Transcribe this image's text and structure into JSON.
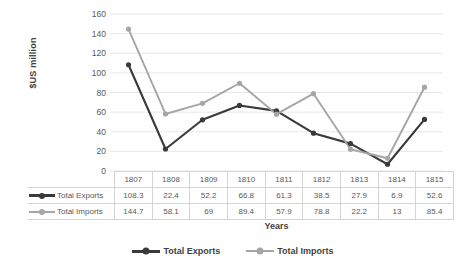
{
  "chart_data": {
    "type": "line",
    "title": "",
    "xlabel": "Years",
    "ylabel": "$US million",
    "categories": [
      "1807",
      "1808",
      "1809",
      "1810",
      "1811",
      "1812",
      "1813",
      "1814",
      "1815"
    ],
    "series": [
      {
        "name": "Total Exports",
        "color": "#3a3a3a",
        "values": [
          108.3,
          22.4,
          52.2,
          66.8,
          61.3,
          38.5,
          27.9,
          6.9,
          52.6
        ]
      },
      {
        "name": "Total Imports",
        "color": "#a6a6a6",
        "values": [
          144.7,
          58.1,
          69,
          89.4,
          57.9,
          78.8,
          22.2,
          13,
          85.4
        ]
      }
    ],
    "ylim": [
      0,
      160
    ],
    "yticks": [
      "0",
      "20",
      "40",
      "60",
      "80",
      "100",
      "120",
      "140",
      "160"
    ],
    "grid": true,
    "legend_position": "bottom",
    "data_table_visible": true
  },
  "data_table": {
    "header": [
      "",
      "1807",
      "1808",
      "1809",
      "1810",
      "1811",
      "1812",
      "1813",
      "1814",
      "1815"
    ],
    "rows": [
      {
        "label": "Total Exports",
        "cells": [
          "108.3",
          "22.4",
          "52.2",
          "66.8",
          "61.3",
          "38.5",
          "27.9",
          "6.9",
          "52.6"
        ]
      },
      {
        "label": "Total Imports",
        "cells": [
          "144.7",
          "58.1",
          "69",
          "89.4",
          "57.9",
          "78.8",
          "22.2",
          "13",
          "85.4"
        ]
      }
    ]
  },
  "legend": {
    "items": [
      {
        "label": "Total Exports"
      },
      {
        "label": "Total Imports"
      }
    ]
  }
}
